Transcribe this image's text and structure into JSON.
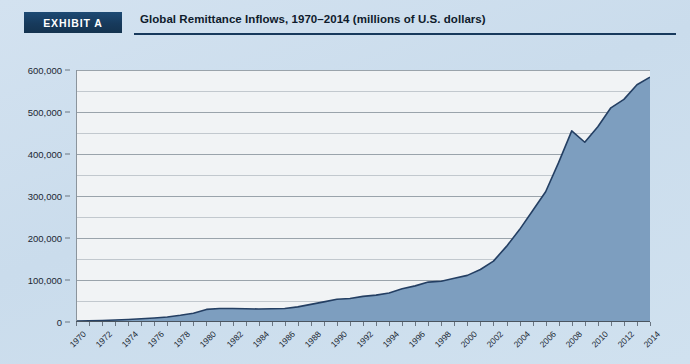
{
  "header": {
    "badge_label": "EXHIBIT A",
    "title": "Global Remittance Inflows, 1970–2014 (millions of U.S. dollars)"
  },
  "colors": {
    "page_background": "#cfe0ef",
    "badge_background": "#17395c",
    "rule": "#17395c",
    "plot_background": "#f1f3f5",
    "area_fill": "#7d9ebf",
    "line_stroke": "#243f63",
    "gridline": "#9aa3ab"
  },
  "chart_data": {
    "type": "area",
    "title": "Global Remittance Inflows, 1970–2014 (millions of U.S. dollars)",
    "xlabel": "",
    "ylabel": "",
    "ylim": [
      0,
      600000
    ],
    "xlim": [
      1970,
      2014
    ],
    "grid": true,
    "legend": "none",
    "y_ticks": [
      0,
      100000,
      200000,
      300000,
      400000,
      500000,
      600000
    ],
    "y_tick_labels": [
      "0",
      "100,000",
      "200,000",
      "300,000",
      "400,000",
      "500,000",
      "600,000"
    ],
    "y_minor_ticks": [
      50000,
      150000,
      250000,
      350000,
      450000,
      550000
    ],
    "x_tick_labels": [
      "1970",
      "1972",
      "1974",
      "1976",
      "1978",
      "1980",
      "1982",
      "1984",
      "1986",
      "1988",
      "1990",
      "1992",
      "1994",
      "1996",
      "1998",
      "2000",
      "2002",
      "2004",
      "2006",
      "2008",
      "2010",
      "2012",
      "2014"
    ],
    "x": [
      1970,
      1971,
      1972,
      1973,
      1974,
      1975,
      1976,
      1977,
      1978,
      1979,
      1980,
      1981,
      1982,
      1983,
      1984,
      1985,
      1986,
      1987,
      1988,
      1989,
      1990,
      1991,
      1992,
      1993,
      1994,
      1995,
      1996,
      1997,
      1998,
      1999,
      2000,
      2001,
      2002,
      2003,
      2004,
      2005,
      2006,
      2007,
      2008,
      2009,
      2010,
      2011,
      2012,
      2013,
      2014
    ],
    "values": [
      2000,
      2600,
      3400,
      4600,
      6000,
      7600,
      9500,
      12000,
      16000,
      21000,
      30000,
      32000,
      32000,
      31500,
      31000,
      31500,
      32000,
      36000,
      42000,
      48000,
      54000,
      56000,
      61000,
      64000,
      69000,
      79000,
      86000,
      95000,
      97000,
      104000,
      111000,
      125000,
      145000,
      180000,
      220000,
      265000,
      310000,
      380000,
      455000,
      428000,
      465000,
      510000,
      530000,
      565000,
      583000
    ],
    "series_name": "Global remittance inflows",
    "units": "millions of U.S. dollars",
    "annotations": [
      {
        "year": 2008,
        "label": "pre-crisis peak",
        "value": 455000
      },
      {
        "year": 2009,
        "label": "financial crisis dip",
        "value": 428000
      },
      {
        "year": 2014,
        "label": "latest value",
        "value": 583000
      }
    ]
  }
}
